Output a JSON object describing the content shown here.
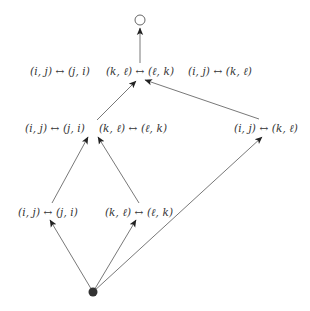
{
  "diagram": {
    "top_node": {
      "shape": "hollow-circle",
      "x": 140,
      "y": 20
    },
    "bottom_node": {
      "shape": "filled-circle",
      "x": 93,
      "y": 292,
      "color": "#333333"
    },
    "rows": {
      "top": [
        {
          "label": "(i, j) ↔ (j, i)",
          "x": 60,
          "y": 71
        },
        {
          "label": "(k, ℓ) ↔ (ℓ, k)",
          "x": 140,
          "y": 71
        },
        {
          "label": "(i, j) ↔ (k, ℓ)",
          "x": 220,
          "y": 71
        }
      ],
      "middle": [
        {
          "label": "(i, j) ↔ (j, i)",
          "x": 55,
          "y": 128
        },
        {
          "label": "(k, ℓ) ↔ (ℓ, k)",
          "x": 133,
          "y": 128
        },
        {
          "label": "(i, j) ↔ (k, ℓ)",
          "x": 266,
          "y": 128
        }
      ],
      "bottom": [
        {
          "label": "(i, j) ↔ (j, i)",
          "x": 48,
          "y": 212
        },
        {
          "label": "(k, ℓ) ↔ (ℓ, k)",
          "x": 139,
          "y": 212
        }
      ]
    },
    "edges": [
      {
        "from": [
          140,
          63
        ],
        "to": [
          140,
          28
        ]
      },
      {
        "from": [
          97,
          120
        ],
        "to": [
          136,
          81
        ]
      },
      {
        "from": [
          259,
          119
        ],
        "to": [
          145,
          80
        ]
      },
      {
        "from": [
          52,
          203
        ],
        "to": [
          88,
          137
        ]
      },
      {
        "from": [
          139,
          203
        ],
        "to": [
          98,
          137
        ]
      },
      {
        "from": [
          93,
          292
        ],
        "to": [
          50,
          220
        ]
      },
      {
        "from": [
          93,
          292
        ],
        "to": [
          136,
          220
        ]
      },
      {
        "from": [
          93,
          292
        ],
        "to": [
          262,
          137
        ]
      }
    ],
    "line_color": "#555555"
  }
}
